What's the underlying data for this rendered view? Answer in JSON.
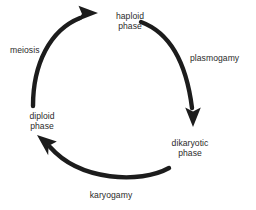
{
  "diagram": {
    "background_color": "#ffffff",
    "text_color": "#2b2b2b",
    "arrow_color": "#1c1c1c",
    "nodes": [
      {
        "id": "haploid-phase",
        "line1": "haploid",
        "line2": "phase",
        "position": "top"
      },
      {
        "id": "dikaryotic-phase",
        "line1": "dikaryotic",
        "line2": "phase",
        "position": "bottom-right"
      },
      {
        "id": "diploid-phase",
        "line1": "diploid",
        "line2": "phase",
        "position": "left"
      }
    ],
    "edges": [
      {
        "id": "plasmogamy",
        "label": "plasmogamy",
        "from": "haploid-phase",
        "to": "dikaryotic-phase",
        "direction": "clockwise-right"
      },
      {
        "id": "karyogamy",
        "label": "karyogamy",
        "from": "dikaryotic-phase",
        "to": "diploid-phase",
        "direction": "clockwise-bottom"
      },
      {
        "id": "meiosis",
        "label": "meiosis",
        "from": "diploid-phase",
        "to": "haploid-phase",
        "direction": "clockwise-left"
      }
    ]
  }
}
